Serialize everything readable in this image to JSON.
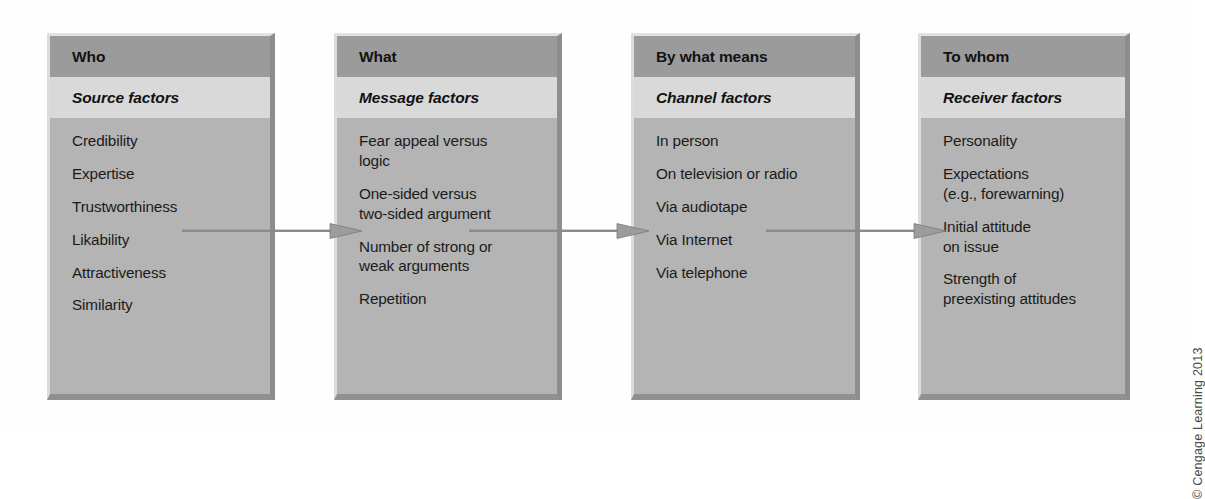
{
  "figure": {
    "kind": "flow-diagram",
    "copyright": "© Cengage Learning 2013",
    "colors": {
      "header_band": "#9b9b9b",
      "subtitle_band": "#d9d9d9",
      "body": "#b4b4b4",
      "bevel_light": "#e2e2e2",
      "bevel_dark": "#8d8d8d",
      "arrow": "#8a8a8a",
      "text": "#1b1b1b",
      "page_background": "#ffffff"
    },
    "boxes": [
      {
        "header": "Who",
        "subtitle": "Source factors",
        "items": [
          "Credibility",
          "Expertise",
          "Trustworthiness",
          "Likability",
          "Attractiveness",
          "Similarity"
        ]
      },
      {
        "header": "What",
        "subtitle": "Message factors",
        "items": [
          "Fear appeal versus\nlogic",
          "One-sided versus\ntwo-sided argument",
          "Number of strong or\nweak arguments",
          "Repetition"
        ]
      },
      {
        "header": "By what means",
        "subtitle": "Channel factors",
        "items": [
          "In person",
          "On television or radio",
          "Via audiotape",
          "Via Internet",
          "Via telephone"
        ]
      },
      {
        "header": "To whom",
        "subtitle": "Receiver factors",
        "items": [
          "Personality",
          "Expectations\n(e.g., forewarning)",
          "Initial attitude\non issue",
          "Strength of\npreexisting attitudes"
        ]
      }
    ],
    "connectors": [
      {
        "name": "who-to-what",
        "direction": "right"
      },
      {
        "name": "what-to-bywhat",
        "direction": "right"
      },
      {
        "name": "bywhat-to-towhom",
        "direction": "right"
      }
    ]
  }
}
